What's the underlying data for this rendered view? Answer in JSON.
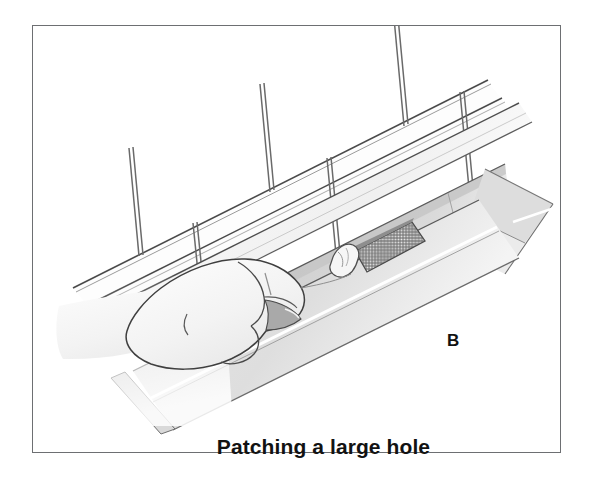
{
  "figure": {
    "caption": "Patching a large hole",
    "panel_letter": "B",
    "alt_description": "Line illustration of a gloved hand pressing a patch into the inside of a roof gutter beneath clapboard siding, with a square of metal mesh laid over a large hole",
    "background_color": "#ffffff",
    "frame_color": "#6d6f72",
    "line_color": "#3c3c3c",
    "text_color": "#121212",
    "shade_light": "#f1f1f1",
    "shade_mid": "#dcdcdc",
    "shade_dark": "#b8b8b8",
    "mesh_color": "#6a6a6a"
  },
  "parts": [
    {
      "name": "siding-boards",
      "label": "Clapboard siding"
    },
    {
      "name": "gutter-trough",
      "label": "Gutter trough"
    },
    {
      "name": "gutter-front-lip",
      "label": "Gutter front lip"
    },
    {
      "name": "gutter-end-cap",
      "label": "Gutter end cap"
    },
    {
      "name": "mesh-patch",
      "label": "Metal mesh patch"
    },
    {
      "name": "gloved-hand",
      "label": "Gloved hand"
    },
    {
      "name": "patch-compound",
      "label": "Roof cement patch"
    },
    {
      "name": "fascia-board",
      "label": "Fascia board"
    }
  ]
}
